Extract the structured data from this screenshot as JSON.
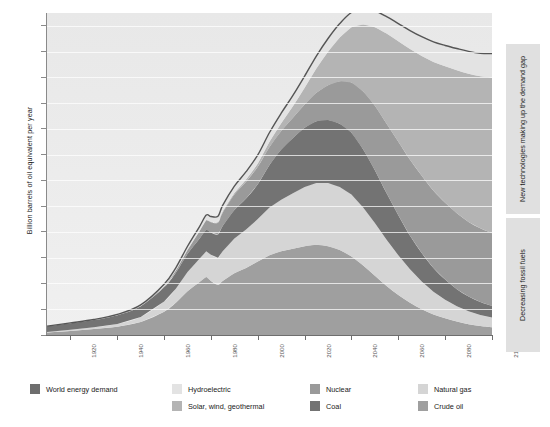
{
  "axes": {
    "ylabel": "Billion barrels of oil equivalent per year",
    "yticks": [
      0,
      10,
      20,
      30,
      40,
      50,
      60,
      70,
      80,
      90,
      100,
      110,
      120
    ],
    "xticks": [
      1920,
      1940,
      1960,
      1980,
      2000,
      2020,
      2040,
      2060,
      2080,
      2100
    ]
  },
  "annotations": {
    "upper": "New technologies making up the demand gap",
    "lower": "Decreasing fossil fuels"
  },
  "legend": [
    {
      "label": "World energy demand",
      "color": "#6e6e6e",
      "col": 0,
      "row": 0
    },
    {
      "label": "Hydroelectric",
      "color": "#e3e3e3",
      "col": 1,
      "row": 0
    },
    {
      "label": "Solar, wind, geothermal",
      "color": "#b4b4b4",
      "col": 1,
      "row": 1
    },
    {
      "label": "Nuclear",
      "color": "#9a9a9a",
      "col": 2,
      "row": 0
    },
    {
      "label": "Coal",
      "color": "#737373",
      "col": 2,
      "row": 1
    },
    {
      "label": "Natural gas",
      "color": "#d5d5d5",
      "col": 3,
      "row": 0
    },
    {
      "label": "Crude oil",
      "color": "#9f9f9f",
      "col": 3,
      "row": 1
    }
  ],
  "chart_data": {
    "type": "area",
    "stacked": true,
    "title": "",
    "xlabel": "",
    "ylabel": "Billion barrels of oil equivalent per year",
    "xlim": [
      1910,
      2100
    ],
    "ylim": [
      0,
      125
    ],
    "grid": true,
    "legend_position": "bottom",
    "x": [
      1910,
      1920,
      1930,
      1940,
      1950,
      1960,
      1965,
      1970,
      1975,
      1978,
      1980,
      1983,
      1985,
      1990,
      1995,
      2000,
      2005,
      2010,
      2015,
      2020,
      2025,
      2030,
      2035,
      2040,
      2045,
      2050,
      2055,
      2060,
      2065,
      2070,
      2075,
      2080,
      2085,
      2090,
      2095,
      2100
    ],
    "series": [
      {
        "name": "Crude oil",
        "color": "#9f9f9f",
        "values": [
          1.0,
          1.6,
          2.3,
          3.2,
          5.0,
          9.0,
          12.5,
          17.0,
          20.5,
          22.5,
          21.0,
          19.5,
          21.0,
          24.0,
          26.0,
          28.5,
          31.0,
          32.5,
          33.5,
          34.5,
          35.0,
          34.5,
          33.0,
          30.5,
          27.0,
          23.0,
          19.0,
          15.5,
          12.5,
          10.0,
          8.0,
          6.5,
          5.2,
          4.2,
          3.5,
          3.0
        ]
      },
      {
        "name": "Natural gas",
        "color": "#d5d5d5",
        "values": [
          0.2,
          0.4,
          0.7,
          1.1,
          2.0,
          4.0,
          5.5,
          7.5,
          9.0,
          10.0,
          10.2,
          10.5,
          11.5,
          13.5,
          15.0,
          16.5,
          18.5,
          20.0,
          21.5,
          23.0,
          24.0,
          24.5,
          24.5,
          24.0,
          22.5,
          20.5,
          18.0,
          15.5,
          13.0,
          10.8,
          8.8,
          7.2,
          6.0,
          5.0,
          4.3,
          3.8
        ]
      },
      {
        "name": "Coal",
        "color": "#737373",
        "values": [
          2.2,
          2.6,
          2.8,
          3.4,
          4.2,
          5.5,
          6.2,
          7.0,
          7.8,
          8.4,
          8.6,
          9.0,
          9.8,
          11.0,
          12.0,
          13.5,
          16.5,
          19.5,
          21.5,
          23.0,
          24.0,
          24.5,
          24.5,
          24.0,
          22.5,
          20.5,
          18.0,
          15.5,
          13.0,
          11.0,
          9.2,
          7.8,
          6.6,
          5.7,
          5.0,
          4.5
        ]
      },
      {
        "name": "Nuclear",
        "color": "#9a9a9a",
        "values": [
          0,
          0,
          0,
          0,
          0,
          0.3,
          0.8,
          1.5,
          2.8,
          3.6,
          4.0,
          4.6,
          5.2,
          6.0,
          6.5,
          6.8,
          7.0,
          7.2,
          7.8,
          9.0,
          11.0,
          13.5,
          16.5,
          19.5,
          22.5,
          25.0,
          27.0,
          28.5,
          29.5,
          30.0,
          30.0,
          29.8,
          29.5,
          29.0,
          28.6,
          28.2
        ]
      },
      {
        "name": "Solar, wind, geothermal",
        "color": "#b4b4b4",
        "values": [
          0,
          0,
          0,
          0,
          0,
          0,
          0,
          0.05,
          0.1,
          0.15,
          0.2,
          0.3,
          0.4,
          0.6,
          0.9,
          1.3,
          2.0,
          3.0,
          4.5,
          6.5,
          9.5,
          13.0,
          17.0,
          21.5,
          26.0,
          30.5,
          35.0,
          39.0,
          43.0,
          46.5,
          50.0,
          53.0,
          55.5,
          57.5,
          59.0,
          60.5
        ]
      },
      {
        "name": "Hydroelectric",
        "color": "#e3e3e3",
        "values": [
          0.05,
          0.1,
          0.2,
          0.3,
          0.5,
          0.9,
          1.1,
          1.4,
          1.7,
          1.9,
          2.0,
          2.2,
          2.4,
          2.7,
          3.0,
          3.3,
          3.6,
          3.9,
          4.2,
          4.5,
          4.8,
          5.1,
          5.4,
          5.7,
          6.0,
          6.3,
          6.6,
          6.9,
          7.2,
          7.5,
          7.8,
          8.1,
          8.4,
          8.7,
          9.0,
          9.3
        ]
      }
    ],
    "demand_line": {
      "name": "World energy demand",
      "color": "#555555",
      "values": [
        3.5,
        4.7,
        6.0,
        8.0,
        11.7,
        19.7,
        26.1,
        34.5,
        41.9,
        46.6,
        46.0,
        46.1,
        50.3,
        57.8,
        63.4,
        69.9,
        78.6,
        86.1,
        93.0,
        100.5,
        108.3,
        115.1,
        120.9,
        125.2,
        126.5,
        125.8,
        123.6,
        120.9,
        118.2,
        115.8,
        113.8,
        112.4,
        111.2,
        110.1,
        109.4,
        109.3
      ]
    }
  }
}
